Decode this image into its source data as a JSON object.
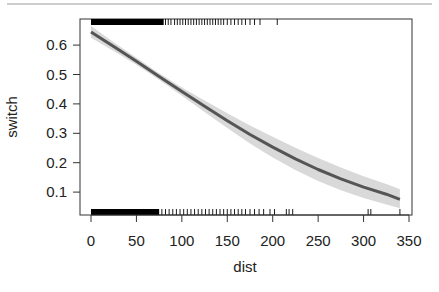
{
  "chart_data": {
    "type": "line",
    "title": "",
    "xlabel": "dist",
    "ylabel": "switch",
    "xlim": [
      -4,
      350
    ],
    "ylim": [
      0.02,
      0.69
    ],
    "x_ticks": [
      0,
      50,
      100,
      150,
      200,
      250,
      300,
      350
    ],
    "x_tick_labels": [
      "0",
      "50",
      "100",
      "150",
      "200",
      "250",
      "300",
      "350"
    ],
    "y_ticks": [
      0.1,
      0.2,
      0.3,
      0.4,
      0.5,
      0.6
    ],
    "y_tick_labels": [
      "0.1",
      "0.2",
      "0.3",
      "0.4",
      "0.5",
      "0.6"
    ],
    "grid": false,
    "legend": null,
    "series": [
      {
        "name": "fitted switch probability",
        "color": "#555555",
        "x": [
          0,
          25,
          50,
          75,
          100,
          125,
          150,
          175,
          200,
          225,
          250,
          275,
          300,
          325,
          340
        ],
        "y": [
          0.645,
          0.595,
          0.545,
          0.493,
          0.442,
          0.392,
          0.343,
          0.296,
          0.253,
          0.213,
          0.177,
          0.145,
          0.117,
          0.093,
          0.075
        ],
        "ci_lower": [
          0.625,
          0.58,
          0.533,
          0.482,
          0.428,
          0.372,
          0.318,
          0.265,
          0.218,
          0.175,
          0.138,
          0.106,
          0.08,
          0.058,
          0.045
        ],
        "ci_upper": [
          0.665,
          0.61,
          0.557,
          0.504,
          0.456,
          0.412,
          0.368,
          0.327,
          0.288,
          0.251,
          0.216,
          0.184,
          0.154,
          0.128,
          0.11
        ],
        "ci_color": "#d9d9d9"
      }
    ],
    "rug": {
      "top": {
        "description": "dist values where switch = 1",
        "dense_range": [
          0,
          80
        ],
        "sparse_x": [
          82,
          85,
          88,
          92,
          95,
          98,
          101,
          104,
          107,
          110,
          113,
          116,
          119,
          122,
          125,
          128,
          131,
          134,
          137,
          140,
          143,
          146,
          150,
          154,
          158,
          162,
          166,
          170,
          175,
          180,
          186,
          205
        ]
      },
      "bottom": {
        "description": "dist values where switch = 0",
        "dense_range": [
          0,
          75
        ],
        "sparse_x": [
          78,
          82,
          86,
          90,
          94,
          98,
          102,
          106,
          110,
          114,
          118,
          122,
          126,
          130,
          134,
          138,
          142,
          146,
          150,
          154,
          158,
          162,
          166,
          170,
          175,
          180,
          185,
          190,
          197,
          202,
          215,
          218,
          222,
          305,
          308,
          340
        ]
      }
    }
  }
}
